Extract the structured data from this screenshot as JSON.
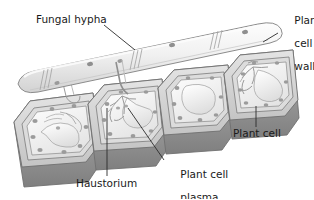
{
  "figure": {
    "type": "biological-diagram",
    "background_color": "#ffffff",
    "line_color": "#555555",
    "text_color": "#1a1a1a"
  },
  "labels": [
    {
      "id": "fungal-hypha",
      "text": "Fungal hypha",
      "lines": [
        "Fungal hypha"
      ],
      "x": 36,
      "y": 20
    },
    {
      "id": "plant-cell-wall",
      "text": "Plant cell wall",
      "lines": [
        "Plant",
        "cell",
        "wall"
      ],
      "x": 281,
      "y": 5
    },
    {
      "id": "plant-cell",
      "text": "Plant cell",
      "lines": [
        "Plant cell"
      ],
      "x": 236,
      "y": 131
    },
    {
      "id": "haustorium",
      "text": "Haustorium",
      "lines": [
        "Haustorium"
      ],
      "x": 78,
      "y": 180
    },
    {
      "id": "plant-cell-plasma-membrane",
      "text": "Plant cell plasma membrane",
      "lines": [
        "Plant cell",
        "plasma",
        "membrane"
      ],
      "x": 167,
      "y": 158
    }
  ],
  "structures": [
    {
      "id": "fungal-hypha-tube",
      "name": "fungal hypha",
      "description": "tubular filament running diagonally above the plant cells, rounded tip at upper right, with septa cross-walls"
    },
    {
      "id": "haustorium-branch",
      "name": "haustorium",
      "description": "branched feeding structure of the fungus extending through the plant cell wall into the cell"
    },
    {
      "id": "plant-cell-1",
      "name": "plant cell",
      "description": "leftmost plant cell, front row"
    },
    {
      "id": "plant-cell-2",
      "name": "plant cell",
      "description": "second plant cell containing a haustorium"
    },
    {
      "id": "plant-cell-3",
      "name": "plant cell",
      "description": "third plant cell"
    },
    {
      "id": "plant-cell-4",
      "name": "plant cell",
      "description": "rightmost plant cell containing a haustorium"
    }
  ],
  "colors": {
    "wall_light": "#e8e8e8",
    "wall_mid": "#c9c9c9",
    "wall_dark": "#9a9a9a",
    "shadow": "#8d8d8d",
    "interior": "#f2f2f2",
    "organelle": "#9b9b9b",
    "hypha_fill": "#f4f4f4",
    "outline": "#6b6b6b"
  }
}
